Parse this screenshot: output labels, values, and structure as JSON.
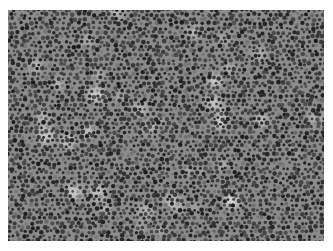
{
  "image": {
    "description": "Grayscale histology micrograph showing densely packed round cells with dark nuclei",
    "alt": "Dense cellular tissue micrograph",
    "colors": {
      "background": "#ffffff",
      "tissue_mid": "#8a8a8a",
      "nucleus_dark": "#2e2e2e",
      "highlight": "#d8d8d8"
    }
  }
}
